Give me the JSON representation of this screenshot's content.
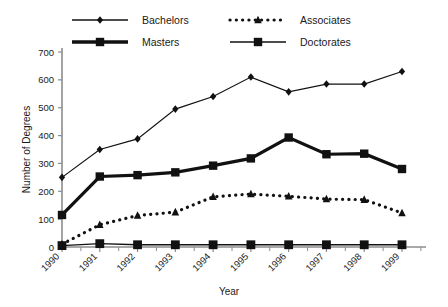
{
  "chart_data": {
    "type": "line",
    "title": "",
    "xlabel": "Year",
    "ylabel": "Number of Degrees",
    "categories": [
      "1990",
      "1991",
      "1992",
      "1993",
      "1994",
      "1995",
      "1996",
      "1997",
      "1998",
      "1999"
    ],
    "x": [
      1990,
      1991,
      1992,
      1993,
      1994,
      1995,
      1996,
      1997,
      1998,
      1999
    ],
    "xlim": [
      1990,
      1999
    ],
    "ylim": [
      0,
      700
    ],
    "yticks": [
      0,
      100,
      200,
      300,
      400,
      500,
      600,
      700
    ],
    "grid": false,
    "legend_position": "top",
    "series": [
      {
        "name": "Bachelors",
        "marker": "diamond",
        "linestyle": "solid",
        "linewidth": 1.2,
        "color": "#111111",
        "values": [
          250,
          350,
          388,
          495,
          540,
          610,
          557,
          585,
          585,
          630
        ]
      },
      {
        "name": "Associates",
        "marker": "triangle",
        "linestyle": "dotted",
        "linewidth": 3.2,
        "color": "#111111",
        "values": [
          10,
          80,
          113,
          125,
          180,
          190,
          182,
          172,
          170,
          122
        ]
      },
      {
        "name": "Masters",
        "marker": "square",
        "linestyle": "solid",
        "linewidth": 3.2,
        "color": "#111111",
        "values": [
          115,
          253,
          258,
          268,
          292,
          318,
          393,
          333,
          335,
          280
        ]
      },
      {
        "name": "Doctorates",
        "marker": "square",
        "linestyle": "solid",
        "linewidth": 1.4,
        "color": "#111111",
        "values": [
          5,
          12,
          8,
          8,
          8,
          8,
          8,
          8,
          8,
          8
        ]
      }
    ]
  },
  "legend": {
    "entries": [
      {
        "label": "Bachelors",
        "marker": "diamond",
        "linestyle": "solid",
        "linewidth": 1.4
      },
      {
        "label": "Associates",
        "marker": "triangle",
        "linestyle": "dotted",
        "linewidth": 3.2
      },
      {
        "label": "Masters",
        "marker": "square",
        "linestyle": "solid",
        "linewidth": 3.4
      },
      {
        "label": "Doctorates",
        "marker": "square",
        "linestyle": "solid",
        "linewidth": 1.6
      }
    ]
  },
  "colors": {
    "ink": "#111111",
    "axis": "#8c8c8c",
    "background": "#ffffff"
  }
}
